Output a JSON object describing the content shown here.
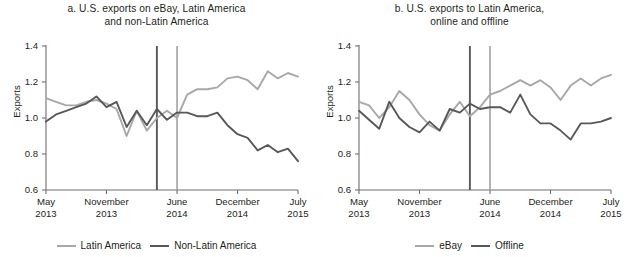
{
  "figure": {
    "axis": {
      "ylabel": "Exports",
      "yticks": [
        "1.4",
        "1.2",
        "1.0",
        "0.8",
        "0.6"
      ],
      "ylim": [
        0.6,
        1.4
      ],
      "xticks": [
        {
          "month": "May",
          "year": "2013"
        },
        {
          "month": "November",
          "year": "2013"
        },
        {
          "month": "June",
          "year": "2014"
        },
        {
          "month": "December",
          "year": "2014"
        },
        {
          "month": "July",
          "year": "2015"
        }
      ]
    },
    "colors": {
      "light_series": "#a8a8a8",
      "dark_series": "#58585a",
      "axis": "#6d6e71",
      "text": "#231f20",
      "background": "#ffffff"
    }
  },
  "panels": [
    {
      "id": "a",
      "title_line1": "a. U.S. exports on eBay, Latin America",
      "title_line2": "and non-Latin America",
      "legend": [
        {
          "label": "Latin America",
          "color": "#a8a8a8",
          "weight": "light"
        },
        {
          "label": "Non-Latin America",
          "color": "#58585a",
          "weight": "dark"
        }
      ]
    },
    {
      "id": "b",
      "title_line1": "b. U.S. exports to Latin America,",
      "title_line2": "online and offline",
      "legend": [
        {
          "label": "eBay",
          "color": "#a8a8a8",
          "weight": "light"
        },
        {
          "label": "Offline",
          "color": "#58585a",
          "weight": "dark"
        }
      ]
    }
  ],
  "chart_data": [
    {
      "type": "line",
      "panel": "a",
      "title": "a. U.S. exports on eBay, Latin America and non-Latin America",
      "xlabel": "",
      "ylabel": "Exports",
      "ylim": [
        0.6,
        1.4
      ],
      "ytick_values": [
        0.6,
        0.8,
        1.0,
        1.2,
        1.4
      ],
      "xlim": [
        "2013-05",
        "2015-07"
      ],
      "xtick_labels": [
        "May 2013",
        "November 2013",
        "June 2014",
        "December 2014",
        "July 2015"
      ],
      "grid": false,
      "legend_position": "below",
      "x": [
        "2013-05",
        "2013-06",
        "2013-07",
        "2013-08",
        "2013-09",
        "2013-10",
        "2013-11",
        "2013-12",
        "2014-01",
        "2014-02",
        "2014-03",
        "2014-04",
        "2014-05",
        "2014-06",
        "2014-07",
        "2014-08",
        "2014-09",
        "2014-10",
        "2014-11",
        "2014-12",
        "2015-01",
        "2015-02",
        "2015-03",
        "2015-04",
        "2015-05",
        "2015-06"
      ],
      "series": [
        {
          "name": "Latin America",
          "color": "#a8a8a8",
          "values": [
            1.11,
            1.09,
            1.07,
            1.07,
            1.09,
            1.1,
            1.08,
            1.05,
            0.9,
            1.04,
            0.93,
            1.0,
            1.04,
            1.0,
            1.13,
            1.16,
            1.16,
            1.17,
            1.22,
            1.23,
            1.21,
            1.16,
            1.26,
            1.22,
            1.25,
            1.23
          ]
        },
        {
          "name": "Non-Latin America",
          "color": "#58585a",
          "values": [
            0.98,
            1.02,
            1.04,
            1.06,
            1.08,
            1.12,
            1.06,
            1.09,
            0.95,
            1.04,
            0.96,
            1.05,
            0.99,
            1.03,
            1.03,
            1.01,
            1.01,
            1.03,
            0.96,
            0.91,
            0.89,
            0.82,
            0.85,
            0.81,
            0.83,
            0.76
          ]
        }
      ],
      "reference_lines": [
        {
          "label": "policy event (dark)",
          "color": "#58585a",
          "x": "2014-04"
        },
        {
          "label": "policy event (light)",
          "color": "#a8a8a8",
          "x": "2014-06"
        }
      ]
    },
    {
      "type": "line",
      "panel": "b",
      "title": "b. U.S. exports to Latin America, online and offline",
      "xlabel": "",
      "ylabel": "Exports",
      "ylim": [
        0.6,
        1.4
      ],
      "ytick_values": [
        0.6,
        0.8,
        1.0,
        1.2,
        1.4
      ],
      "xlim": [
        "2013-05",
        "2015-07"
      ],
      "xtick_labels": [
        "May 2013",
        "November 2013",
        "June 2014",
        "December 2014",
        "July 2015"
      ],
      "grid": false,
      "legend_position": "below",
      "x": [
        "2013-05",
        "2013-06",
        "2013-07",
        "2013-08",
        "2013-09",
        "2013-10",
        "2013-11",
        "2013-12",
        "2014-01",
        "2014-02",
        "2014-03",
        "2014-04",
        "2014-05",
        "2014-06",
        "2014-07",
        "2014-08",
        "2014-09",
        "2014-10",
        "2014-11",
        "2014-12",
        "2015-01",
        "2015-02",
        "2015-03",
        "2015-04",
        "2015-05",
        "2015-06"
      ],
      "series": [
        {
          "name": "eBay",
          "color": "#a8a8a8",
          "values": [
            1.09,
            1.07,
            1.0,
            1.06,
            1.15,
            1.1,
            1.02,
            0.96,
            0.93,
            1.02,
            1.09,
            1.01,
            1.06,
            1.13,
            1.15,
            1.18,
            1.21,
            1.18,
            1.21,
            1.17,
            1.1,
            1.18,
            1.22,
            1.18,
            1.22,
            1.24
          ]
        },
        {
          "name": "Offline",
          "color": "#58585a",
          "values": [
            1.04,
            0.99,
            0.94,
            1.09,
            1.0,
            0.95,
            0.92,
            0.98,
            0.93,
            1.05,
            1.03,
            1.08,
            1.05,
            1.06,
            1.06,
            1.03,
            1.13,
            1.02,
            0.97,
            0.97,
            0.93,
            0.88,
            0.97,
            0.97,
            0.98,
            1.0
          ]
        }
      ],
      "reference_lines": [
        {
          "label": "policy event (dark)",
          "color": "#58585a",
          "x": "2014-04"
        },
        {
          "label": "policy event (light)",
          "color": "#a8a8a8",
          "x": "2014-06"
        }
      ]
    }
  ]
}
